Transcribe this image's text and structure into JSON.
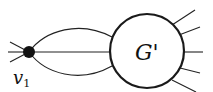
{
  "diagram": {
    "type": "graph-schematic",
    "vertex": {
      "label": "v",
      "subscript": "1",
      "style": "filled-dot",
      "color": "#111111"
    },
    "subgraph": {
      "label": "G'",
      "style": "circle"
    },
    "edges_vertex_to_subgraph": {
      "count": 3,
      "shapes": [
        "upper-arc",
        "straight",
        "lower-arc"
      ]
    },
    "vertex_stub_edges": {
      "count": 3,
      "direction": "left"
    },
    "subgraph_stub_edges": {
      "count": 5,
      "direction": "right"
    },
    "line_color": "#222222"
  }
}
